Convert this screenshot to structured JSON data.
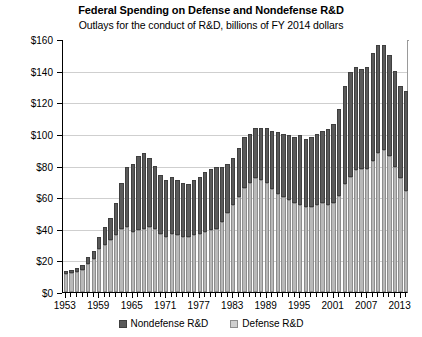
{
  "chart_data": {
    "type": "bar",
    "stacked": true,
    "title": "Federal Spending on Defense and Nondefense R&D",
    "subtitle": "Outlays for the conduct of R&D, billions of FY 2014 dollars",
    "xlabel": "",
    "ylabel": "",
    "ylim": [
      0,
      160
    ],
    "ytick_step": 20,
    "ytick_labels": [
      "$0",
      "$20",
      "$40",
      "$60",
      "$80",
      "$100",
      "$120",
      "$140",
      "$160"
    ],
    "ytick_values": [
      0,
      20,
      40,
      60,
      80,
      100,
      120,
      140,
      160
    ],
    "grid": true,
    "legend_position": "bottom",
    "xtick_labels": [
      "1953",
      "1959",
      "1965",
      "1971",
      "1977",
      "1983",
      "1989",
      "1995",
      "2001",
      "2007",
      "2013"
    ],
    "xtick_label_years": [
      1953,
      1959,
      1965,
      1971,
      1977,
      1983,
      1989,
      1995,
      2001,
      2007,
      2013
    ],
    "categories": [
      1953,
      1954,
      1955,
      1956,
      1957,
      1958,
      1959,
      1960,
      1961,
      1962,
      1963,
      1964,
      1965,
      1966,
      1967,
      1968,
      1969,
      1970,
      1971,
      1972,
      1973,
      1974,
      1975,
      1976,
      1977,
      1978,
      1979,
      1980,
      1981,
      1982,
      1983,
      1984,
      1985,
      1986,
      1987,
      1988,
      1989,
      1990,
      1991,
      1992,
      1993,
      1994,
      1995,
      1996,
      1997,
      1998,
      1999,
      2000,
      2001,
      2002,
      2003,
      2004,
      2005,
      2006,
      2007,
      2008,
      2009,
      2010,
      2011,
      2012,
      2013,
      2014
    ],
    "series": [
      {
        "name": "Defense R&D",
        "color": "#b9b9b9",
        "values": [
          11.5,
          12.0,
          12.5,
          14.0,
          18.0,
          21.0,
          27.0,
          30.0,
          33.0,
          36.0,
          40.0,
          41.0,
          38.0,
          39.0,
          40.0,
          41.0,
          40.0,
          37.0,
          35.0,
          37.0,
          36.0,
          35.0,
          35.0,
          36.0,
          37.0,
          38.0,
          39.0,
          40.0,
          44.0,
          50.0,
          55.0,
          60.0,
          66.0,
          69.0,
          72.0,
          71.0,
          69.0,
          65.0,
          62.0,
          60.0,
          58.0,
          56.0,
          55.0,
          54.0,
          54.0,
          55.0,
          56.0,
          55.0,
          56.0,
          61.0,
          68.0,
          73.0,
          77.0,
          78.0,
          78.0,
          83.0,
          88.0,
          90.0,
          86.0,
          79.0,
          72.0,
          64.0
        ]
      },
      {
        "name": "Nondefense R&D",
        "color": "#5a5a5a",
        "values": [
          1.5,
          2.0,
          2.5,
          3.0,
          4.0,
          5.0,
          8.0,
          11.0,
          14.0,
          20.0,
          29.0,
          38.0,
          43.0,
          47.0,
          48.0,
          44.0,
          40.0,
          37.0,
          36.0,
          36.0,
          35.0,
          34.0,
          33.0,
          35.0,
          36.0,
          38.0,
          39.0,
          39.0,
          35.0,
          31.0,
          30.0,
          31.0,
          32.0,
          31.0,
          32.0,
          33.0,
          35.0,
          37.0,
          39.0,
          40.0,
          41.0,
          42.0,
          44.0,
          43.0,
          44.0,
          45.0,
          46.0,
          48.0,
          50.0,
          55.0,
          62.0,
          66.0,
          65.0,
          63.0,
          64.0,
          68.0,
          68.0,
          66.0,
          64.0,
          61.0,
          58.0,
          63.0
        ]
      }
    ]
  },
  "legend": {
    "items": [
      {
        "label": "Nondefense R&D",
        "swatch": "dark-swatch"
      },
      {
        "label": "Defense R&D",
        "swatch": "light-swatch"
      }
    ]
  }
}
